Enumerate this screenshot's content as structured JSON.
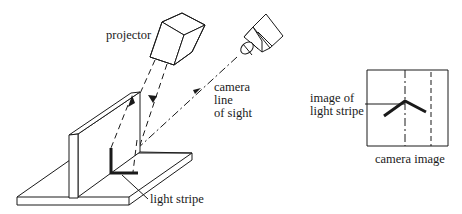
{
  "labels": {
    "projector": "projector",
    "camera_line_1": "camera",
    "camera_line_2": "line",
    "camera_line_3": "of sight",
    "light_stripe": "light stripe",
    "image_of_1": "image of",
    "image_of_2": "light stripe",
    "camera_image": "camera image"
  },
  "colors": {
    "line": "#1a1a1a",
    "background": "#ffffff"
  }
}
